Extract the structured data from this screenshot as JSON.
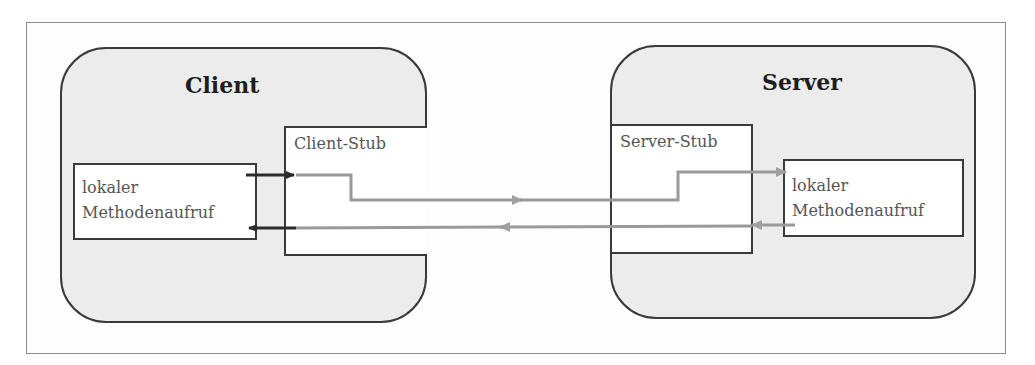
{
  "diagram": {
    "client": {
      "title": "Client",
      "stub_label": "Client-Stub",
      "local_call": {
        "line1": "lokaler",
        "line2": "Methodenaufruf"
      }
    },
    "server": {
      "title": "Server",
      "stub_label": "Server-Stub",
      "local_call": {
        "line1": "lokaler",
        "line2": "Methodenaufruf"
      }
    },
    "colors": {
      "border": "#3a3a3a",
      "container_fill": "#ececec",
      "box_fill": "#ffffff",
      "local_arrow": "#2b2b2b",
      "network_arrow": "#9a9a9a",
      "frame": "#8a8a8a"
    },
    "edges": [
      {
        "from": "client-local-call",
        "to": "client-stub",
        "direction": "request"
      },
      {
        "from": "client-stub",
        "to": "server-stub",
        "direction": "request"
      },
      {
        "from": "server-stub",
        "to": "server-local-call",
        "direction": "request"
      },
      {
        "from": "server-local-call",
        "to": "server-stub",
        "direction": "response"
      },
      {
        "from": "server-stub",
        "to": "client-stub",
        "direction": "response"
      },
      {
        "from": "client-stub",
        "to": "client-local-call",
        "direction": "response"
      }
    ]
  }
}
